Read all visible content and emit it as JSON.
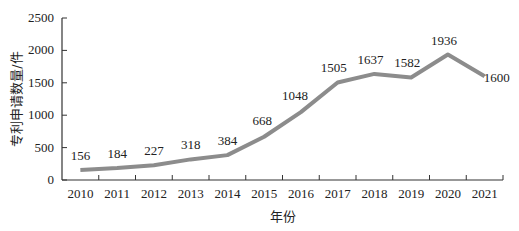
{
  "chart_data": {
    "type": "line",
    "title": "",
    "xlabel": "年份",
    "ylabel": "专利申请数量/件",
    "categories": [
      "2010",
      "2011",
      "2012",
      "2013",
      "2014",
      "2015",
      "2016",
      "2017",
      "2018",
      "2019",
      "2020",
      "2021"
    ],
    "series": [
      {
        "name": "专利申请数量",
        "values": [
          156,
          184,
          227,
          318,
          384,
          668,
          1048,
          1505,
          1637,
          1582,
          1936,
          1600
        ],
        "color": "#8c8c8c"
      }
    ],
    "ylim": [
      0,
      2500
    ],
    "yticks": [
      0,
      500,
      1000,
      1500,
      2000,
      2500
    ],
    "grid": false,
    "legend": "none",
    "data_labels": [
      "156",
      "184",
      "227",
      "318",
      "384",
      "668",
      "1048",
      "1505",
      "1637",
      "1582",
      "1936",
      "1600"
    ]
  }
}
